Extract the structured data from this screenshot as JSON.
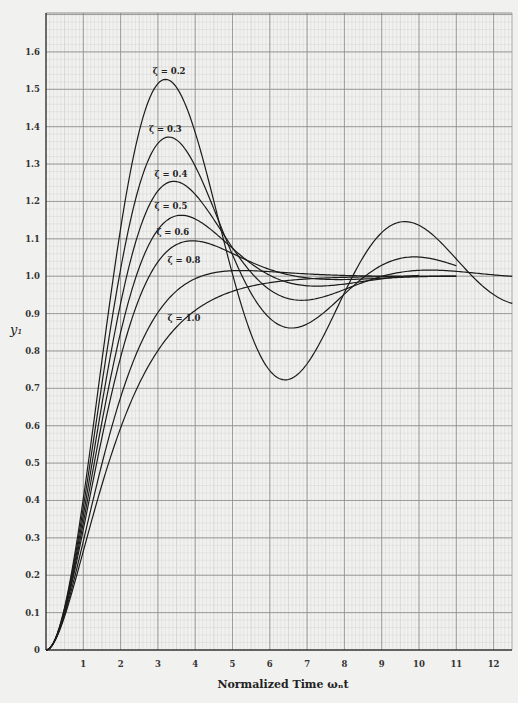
{
  "chart_data": {
    "type": "line",
    "title": "",
    "xlabel": "Normalized Time ωₙt",
    "ylabel": "y₁",
    "xlim": [
      0,
      12.5
    ],
    "ylim": [
      0,
      1.7
    ],
    "grid": true,
    "x_ticks": [
      "1",
      "2",
      "3",
      "4",
      "5",
      "6",
      "7",
      "8",
      "9",
      "10",
      "11",
      "12"
    ],
    "y_ticks": [
      "0",
      "0.1",
      "0.2",
      "0.3",
      "0.4",
      "0.5",
      "0.6",
      "0.7",
      "0.8",
      "0.9",
      "1.0",
      "1.1",
      "1.2",
      "1.3",
      "1.4",
      "1.5",
      "1.6"
    ],
    "series": [
      {
        "name": "ζ = 0.2",
        "zeta": 0.2,
        "t_end": 12.5,
        "label_at": [
          3.3,
          1.54
        ],
        "x": [
          0,
          1,
          2,
          3,
          3.2,
          4,
          5,
          6,
          6.4,
          7,
          8,
          9,
          9.6,
          10,
          11,
          12
        ],
        "values": [
          0,
          0.43,
          1.22,
          1.52,
          1.53,
          1.38,
          1.06,
          0.77,
          0.74,
          0.78,
          0.98,
          1.12,
          1.14,
          1.12,
          1.04,
          0.97
        ]
      },
      {
        "name": "ζ = 0.3",
        "zeta": 0.3,
        "t_end": 11.0,
        "label_at": [
          3.2,
          1.385
        ],
        "x": [
          0,
          1,
          2,
          3,
          3.3,
          4,
          5,
          6,
          6.6,
          7,
          8,
          9,
          10,
          11
        ],
        "values": [
          0,
          0.41,
          1.13,
          1.36,
          1.37,
          1.28,
          1.06,
          0.89,
          0.87,
          0.88,
          0.96,
          1.03,
          1.05,
          1.03
        ]
      },
      {
        "name": "ζ = 0.4",
        "zeta": 0.4,
        "t_end": 12.5,
        "label_at": [
          3.35,
          1.265
        ],
        "x": [
          0,
          1,
          2,
          3,
          3.4,
          4,
          5,
          6,
          7,
          8,
          9,
          10,
          11,
          12
        ],
        "values": [
          0,
          0.39,
          1.05,
          1.24,
          1.25,
          1.21,
          1.05,
          0.95,
          0.95,
          0.99,
          1.02,
          1.02,
          1.01,
          1.0
        ]
      },
      {
        "name": "ζ = 0.5",
        "zeta": 0.5,
        "t_end": 10.0,
        "label_at": [
          3.35,
          1.18
        ],
        "x": [
          0,
          1,
          2,
          3,
          3.6,
          4,
          5,
          6,
          7,
          8,
          9,
          10
        ],
        "values": [
          0,
          0.38,
          0.97,
          1.15,
          1.16,
          1.15,
          1.07,
          0.99,
          0.98,
          0.99,
          1.0,
          1.0
        ]
      },
      {
        "name": "ζ = 0.6",
        "zeta": 0.6,
        "t_end": 11.0,
        "label_at": [
          3.4,
          1.11
        ],
        "x": [
          0,
          1,
          2,
          3,
          3.9,
          4,
          5,
          6,
          7,
          8,
          9,
          10,
          11
        ],
        "values": [
          0,
          0.36,
          0.9,
          1.07,
          1.09,
          1.09,
          1.06,
          1.02,
          1.0,
          0.99,
          1.0,
          1.0,
          1.0
        ]
      },
      {
        "name": "ζ = 0.8",
        "zeta": 0.8,
        "t_end": 11.0,
        "label_at": [
          3.7,
          1.035
        ],
        "x": [
          0,
          1,
          2,
          3,
          4,
          5,
          6,
          7,
          8,
          9,
          10,
          11
        ],
        "values": [
          0,
          0.32,
          0.77,
          0.95,
          1.01,
          1.02,
          1.01,
          1.0,
          1.0,
          1.0,
          1.0,
          1.0
        ]
      },
      {
        "name": "ζ = 1.0",
        "zeta": 1.0,
        "t_end": 11.0,
        "label_at": [
          3.7,
          0.88
        ],
        "x": [
          0,
          1,
          2,
          3,
          4,
          5,
          6,
          7,
          8,
          9,
          10,
          11
        ],
        "values": [
          0,
          0.26,
          0.59,
          0.8,
          0.91,
          0.96,
          0.98,
          0.99,
          1.0,
          1.0,
          1.0,
          1.0
        ]
      }
    ]
  }
}
